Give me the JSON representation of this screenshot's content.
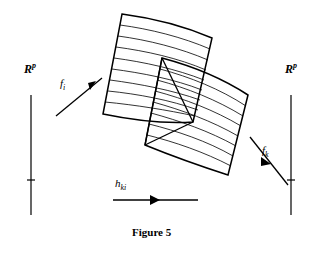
{
  "figure": {
    "caption": "Figure 5",
    "background_color": "#ffffff",
    "stroke_color": "#000000"
  },
  "labels": {
    "rp_left": {
      "base": "R",
      "sup": "p",
      "name": "R^p"
    },
    "rp_right": {
      "base": "R",
      "sup": "p",
      "name": "R^p"
    },
    "f_i": {
      "base": "f",
      "sub": "i",
      "name": "f_i"
    },
    "f_k": {
      "base": "f",
      "sub": "k",
      "name": "f_k"
    },
    "h_ki": {
      "base": "h",
      "sub": "ki",
      "name": "h_ki"
    }
  },
  "axes": {
    "left": {
      "x": 31,
      "y_top": 95,
      "y_bottom": 215,
      "tick_y": 180,
      "tick_half_width": 4
    },
    "right": {
      "x": 291,
      "y_top": 95,
      "y_bottom": 215,
      "tick_y": 180,
      "tick_half_width": 4
    }
  },
  "arrows": {
    "f_i": {
      "x1": 56,
      "y1": 116,
      "x2": 102,
      "y2": 78,
      "head_at": "end",
      "direction": "up-right"
    },
    "f_k": {
      "x1": 250,
      "y1": 137,
      "x2": 288,
      "y2": 185,
      "head_at": "middle",
      "direction": "down-right"
    },
    "h_ki": {
      "x1": 113,
      "y1": 200,
      "x2": 198,
      "y2": 200,
      "head_at": "middle",
      "direction": "right"
    }
  },
  "shapes": {
    "patch_upper": {
      "name": "curved-quadrilateral-upper-left",
      "corners": [
        [
          122,
          14
        ],
        [
          212,
          38
        ],
        [
          193,
          122
        ],
        [
          103,
          114
        ]
      ],
      "striation_count": 9
    },
    "patch_lower": {
      "name": "curved-quadrilateral-lower-right",
      "corners": [
        [
          162,
          58
        ],
        [
          248,
          95
        ],
        [
          228,
          175
        ],
        [
          145,
          145
        ]
      ],
      "striation_count": 8
    },
    "overlap": {
      "name": "overlap-region",
      "corners": [
        [
          162,
          58
        ],
        [
          193,
          122
        ],
        [
          145,
          145
        ],
        [
          103,
          114
        ]
      ]
    }
  }
}
